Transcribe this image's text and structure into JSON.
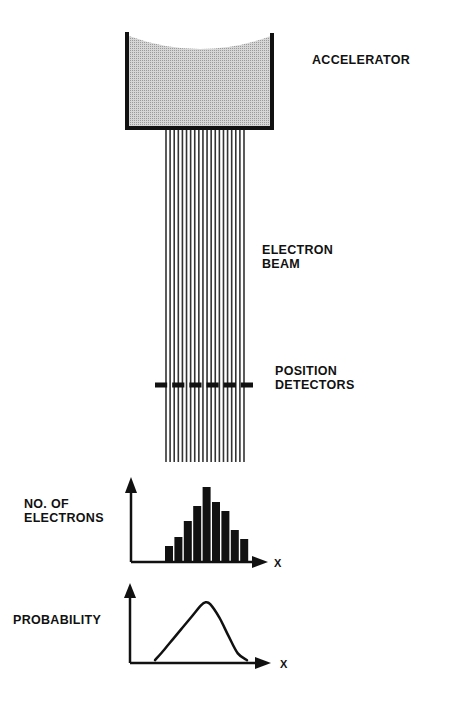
{
  "labels": {
    "accelerator": "ACCELERATOR",
    "electron_beam": [
      "ELECTRON",
      "BEAM"
    ],
    "position_detectors": [
      "POSITION",
      "DETECTORS"
    ],
    "no_of_electrons": [
      "NO. OF",
      "ELECTRONS"
    ],
    "probability": "PROBABILITY",
    "x_axis_histogram": "X",
    "x_axis_probability": "X"
  },
  "beam": {
    "line_count": 20,
    "detector_dash_count": 6
  },
  "colors": {
    "ink": "#111111",
    "fill": "#c8c8c8",
    "background": "#ffffff"
  },
  "chart_data": [
    {
      "type": "bar",
      "title": "",
      "ylabel": "NO. OF ELECTRONS",
      "xlabel": "X",
      "categories": [
        "1",
        "2",
        "3",
        "4",
        "5",
        "6",
        "7",
        "8",
        "9"
      ],
      "values": [
        15,
        24,
        40,
        55,
        74,
        59,
        50,
        31,
        22
      ],
      "ylim": [
        0,
        84
      ],
      "grid": false
    },
    {
      "type": "line",
      "title": "",
      "ylabel": "PROBABILITY",
      "xlabel": "X",
      "x": [
        0,
        0.1,
        0.2,
        0.3,
        0.4,
        0.5,
        0.55,
        0.6,
        0.7,
        0.8,
        0.9,
        1.0
      ],
      "y": [
        0.03,
        0.2,
        0.38,
        0.56,
        0.74,
        0.92,
        0.97,
        0.94,
        0.72,
        0.42,
        0.14,
        0.03
      ],
      "ylim": [
        0,
        1.3
      ],
      "grid": false
    }
  ]
}
